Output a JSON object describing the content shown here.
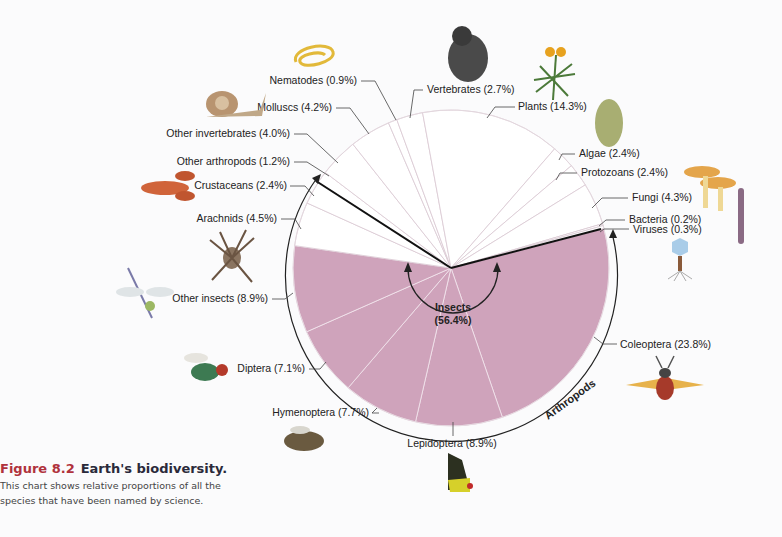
{
  "chart_data": {
    "type": "pie",
    "title": "Earth's biodiversity",
    "center_label": {
      "name": "Insects",
      "value": "(56.4%)"
    },
    "group_label": "Arthropods",
    "slices": [
      {
        "name": "Coleoptera",
        "value": 23.8,
        "label": "Coleoptera (23.8%)",
        "group": "insects"
      },
      {
        "name": "Lepidoptera",
        "value": 8.9,
        "label": "Lepidoptera (8.9%)",
        "group": "insects"
      },
      {
        "name": "Hymenoptera",
        "value": 7.7,
        "label": "Hymenoptera (7.7%)",
        "group": "insects"
      },
      {
        "name": "Diptera",
        "value": 7.1,
        "label": "Diptera (7.1%)",
        "group": "insects"
      },
      {
        "name": "Other insects",
        "value": 8.9,
        "label": "Other insects (8.9%)",
        "group": "insects"
      },
      {
        "name": "Arachnids",
        "value": 4.5,
        "label": "Arachnids (4.5%)",
        "group": "arthropods"
      },
      {
        "name": "Crustaceans",
        "value": 2.4,
        "label": "Crustaceans (2.4%)",
        "group": "arthropods"
      },
      {
        "name": "Other arthropods",
        "value": 1.2,
        "label": "Other arthropods (1.2%)",
        "group": "arthropods"
      },
      {
        "name": "Other invertebrates",
        "value": 4.0,
        "label": "Other invertebrates (4.0%)",
        "group": "other"
      },
      {
        "name": "Molluscs",
        "value": 4.2,
        "label": "Molluscs (4.2%)",
        "group": "other"
      },
      {
        "name": "Nematodes",
        "value": 0.9,
        "label": "Nematodes (0.9%)",
        "group": "other"
      },
      {
        "name": "Vertebrates",
        "value": 2.7,
        "label": "Vertebrates (2.7%)",
        "group": "other"
      },
      {
        "name": "Plants",
        "value": 14.3,
        "label": "Plants (14.3%)",
        "group": "other"
      },
      {
        "name": "Algae",
        "value": 2.4,
        "label": "Algae (2.4%)",
        "group": "other"
      },
      {
        "name": "Protozoans",
        "value": 2.4,
        "label": "Protozoans (2.4%)",
        "group": "other"
      },
      {
        "name": "Fungi",
        "value": 4.3,
        "label": "Fungi (4.3%)",
        "group": "other"
      },
      {
        "name": "Bacteria",
        "value": 0.2,
        "label": "Bacteria (0.2%)",
        "group": "other"
      },
      {
        "name": "Viruses",
        "value": 0.3,
        "label": "Viruses (0.3%)",
        "group": "other"
      }
    ],
    "colors": {
      "insects": "#cfa3bb",
      "other": "#ffffff",
      "slice_line": "#d9c8d2",
      "insect_line": "#f3e6ee",
      "outline": "#222222"
    }
  },
  "caption": {
    "figure": "Figure 8.2",
    "title": "Earth's biodiversity.",
    "body_line1": "This chart shows relative proportions of all the",
    "body_line2": "species that have been named by science."
  }
}
